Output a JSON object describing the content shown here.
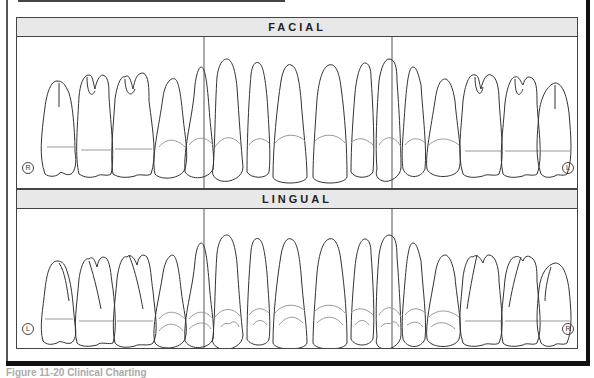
{
  "panels": [
    {
      "title": "FACIAL",
      "left_marker": "R",
      "right_marker": "L",
      "teeth_count": 16
    },
    {
      "title": "LINGUAL",
      "left_marker": "L",
      "right_marker": "R",
      "teeth_count": 16
    }
  ],
  "caption": "Figure 11-20   Clinical Charting"
}
